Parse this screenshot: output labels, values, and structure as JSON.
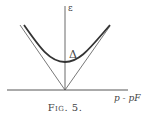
{
  "figure": {
    "caption": "Fig. 5.",
    "y_axis_label": "ε",
    "x_axis_label": "p - pF",
    "gap_label": "Δ"
  }
}
